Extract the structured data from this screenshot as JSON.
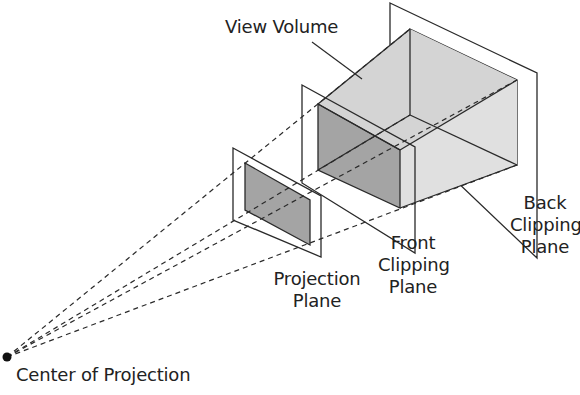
{
  "diagram": {
    "labels": {
      "view_volume": "View Volume",
      "back_clipping_plane": [
        "Back",
        "Clipping",
        "Plane"
      ],
      "front_clipping_plane": [
        "Front",
        "Clipping",
        "Plane"
      ],
      "projection_plane": [
        "Projection",
        "Plane"
      ],
      "center_of_projection": "Center of Projection"
    },
    "colors": {
      "stroke": "#2a2a2a",
      "face_dark": "#9c9c9c",
      "face_mid": "#b8b8b8",
      "face_light": "#d6d6d6",
      "face_lighter": "#e4e4e4",
      "background": "#ffffff"
    }
  }
}
